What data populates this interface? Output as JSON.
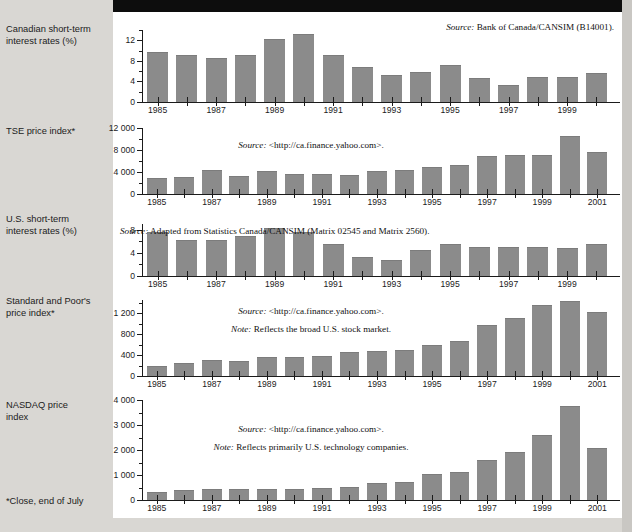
{
  "footnote": "*Close, end of July",
  "colors": {
    "bar": "#8b8b8b",
    "panel": "#ffffff",
    "page_bg": "#d9d7d3",
    "topbar": "#0d0d0d"
  },
  "charts": [
    {
      "id": "canadian-short-term-interest-rates",
      "label_line1": "Canadian short-term",
      "label_line2": "interest rates (%)",
      "source_label": "Source:",
      "source_text": "Bank of Canada/CANSIM (B14001).",
      "note_label": "",
      "note_text": "",
      "chart_data": {
        "type": "bar",
        "title": "Canadian short-term interest rates (%)",
        "xlabel": "",
        "ylabel": "Canadian short-term interest rates (%)",
        "ylim": [
          0,
          14
        ],
        "yticks": [
          0,
          4,
          8,
          12
        ],
        "ytick_labels": [
          "0",
          "4",
          "8",
          "12"
        ],
        "grid": false,
        "categories": [
          "1985",
          "1986",
          "1987",
          "1988",
          "1989",
          "1990",
          "1991",
          "1992",
          "1993",
          "1994",
          "1995",
          "1996",
          "1997",
          "1998",
          "1999",
          "2000"
        ],
        "xtick_labels": [
          "1985",
          "",
          "1987",
          "",
          "1989",
          "",
          "1991",
          "",
          "1993",
          "",
          "1995",
          "",
          "1997",
          "",
          "1999",
          ""
        ],
        "values": [
          9.5,
          9.0,
          8.4,
          9.0,
          12.0,
          13.0,
          9.0,
          6.7,
          5.0,
          5.6,
          7.0,
          4.4,
          3.2,
          4.7,
          4.7,
          5.5
        ]
      }
    },
    {
      "id": "tse-price-index",
      "label_line1": "TSE price index*",
      "label_line2": "",
      "source_label": "Source:",
      "source_text": "<http://ca.finance.yahoo.com>.",
      "note_label": "",
      "note_text": "",
      "chart_data": {
        "type": "bar",
        "title": "TSE price index*",
        "xlabel": "",
        "ylabel": "TSE price index*",
        "ylim": [
          0,
          12000
        ],
        "yticks": [
          0,
          4000,
          8000,
          12000
        ],
        "ytick_labels": [
          "0",
          "4 000",
          "8 000",
          "12 000"
        ],
        "grid": false,
        "categories": [
          "1985",
          "1986",
          "1987",
          "1988",
          "1989",
          "1990",
          "1991",
          "1992",
          "1993",
          "1994",
          "1995",
          "1996",
          "1997",
          "1998",
          "1999",
          "2000",
          "2001"
        ],
        "xtick_labels": [
          "1985",
          "",
          "1987",
          "",
          "1989",
          "",
          "1991",
          "",
          "1993",
          "",
          "1995",
          "",
          "1997",
          "",
          "1999",
          "",
          "2001"
        ],
        "values": [
          2700,
          2900,
          4100,
          3100,
          4050,
          3450,
          3400,
          3250,
          4050,
          4250,
          4700,
          5100,
          6700,
          6900,
          6850,
          10400,
          7450
        ]
      }
    },
    {
      "id": "us-short-term-interest-rates",
      "label_line1": "U.S. short-term",
      "label_line2": "interest rates (%)",
      "source_label": "Source:",
      "source_text": "Adapted from Statistics Canada/CANSIM (Matrix 02545 and Matrix 2560).",
      "note_label": "",
      "note_text": "",
      "chart_data": {
        "type": "bar",
        "title": "U.S. short-term interest rates (%)",
        "xlabel": "",
        "ylabel": "U.S. short-term interest rates (%)",
        "ylim": [
          0,
          9
        ],
        "yticks": [
          0,
          4,
          8
        ],
        "ytick_labels": [
          "0",
          "4",
          "8"
        ],
        "grid": false,
        "categories": [
          "1985",
          "1986",
          "1987",
          "1988",
          "1989",
          "1990",
          "1991",
          "1992",
          "1993",
          "1994",
          "1995",
          "1996",
          "1997",
          "1998",
          "1999",
          "2000"
        ],
        "xtick_labels": [
          "1985",
          "",
          "1987",
          "",
          "1989",
          "",
          "1991",
          "",
          "1993",
          "",
          "1995",
          "",
          "1997",
          "",
          "1999",
          ""
        ],
        "values": [
          7.4,
          6.1,
          6.0,
          6.7,
          8.2,
          7.4,
          5.4,
          3.2,
          2.6,
          4.3,
          5.4,
          4.9,
          4.9,
          4.8,
          4.6,
          5.4
        ]
      }
    },
    {
      "id": "standard-and-poors-price-index",
      "label_line1": "Standard and Poor's",
      "label_line2": "price index*",
      "source_label": "Source:",
      "source_text": "<http://ca.finance.yahoo.com>.",
      "note_label": "Note:",
      "note_text": "Reflects the broad U.S. stock market.",
      "chart_data": {
        "type": "bar",
        "title": "Standard and Poor's price index*",
        "xlabel": "",
        "ylabel": "Standard and Poor's price index*",
        "ylim": [
          0,
          1450
        ],
        "yticks": [
          0,
          400,
          800,
          1200
        ],
        "ytick_labels": [
          "0",
          "400",
          "800",
          "1 200"
        ],
        "grid": false,
        "categories": [
          "1985",
          "1986",
          "1987",
          "1988",
          "1989",
          "1990",
          "1991",
          "1992",
          "1993",
          "1994",
          "1995",
          "1996",
          "1997",
          "1998",
          "1999",
          "2000",
          "2001"
        ],
        "xtick_labels": [
          "1985",
          "",
          "1987",
          "",
          "1989",
          "",
          "1991",
          "",
          "1993",
          "",
          "1995",
          "",
          "1997",
          "",
          "1999",
          "",
          "2001"
        ],
        "values": [
          180,
          225,
          280,
          265,
          340,
          340,
          370,
          440,
          465,
          470,
          570,
          650,
          945,
          1090,
          1330,
          1410,
          1200
        ]
      }
    },
    {
      "id": "nasdaq-price-index",
      "label_line1": "NASDAQ price",
      "label_line2": "index",
      "source_label": "Source:",
      "source_text": "<http://ca.finance.yahoo.com>.",
      "note_label": "Note:",
      "note_text": "Reflects primarily U.S. technology companies.",
      "chart_data": {
        "type": "bar",
        "title": "NASDAQ price index",
        "xlabel": "",
        "ylabel": "NASDAQ price index",
        "ylim": [
          0,
          4000
        ],
        "yticks": [
          0,
          1000,
          2000,
          3000,
          4000
        ],
        "ytick_labels": [
          "0",
          "1 000",
          "2 000",
          "3 000",
          "4 000"
        ],
        "grid": false,
        "categories": [
          "1985",
          "1986",
          "1987",
          "1988",
          "1989",
          "1990",
          "1991",
          "1992",
          "1993",
          "1994",
          "1995",
          "1996",
          "1997",
          "1998",
          "1999",
          "2000",
          "2001"
        ],
        "xtick_labels": [
          "1985",
          "",
          "1987",
          "",
          "1989",
          "",
          "1991",
          "",
          "1993",
          "",
          "1995",
          "",
          "1997",
          "",
          "1999",
          "",
          "2001"
        ],
        "values": [
          280,
          370,
          420,
          390,
          420,
          390,
          440,
          490,
          660,
          700,
          990,
          1090,
          1580,
          1880,
          2570,
          3720,
          2050
        ]
      }
    }
  ]
}
